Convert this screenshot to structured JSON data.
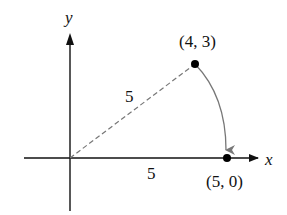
{
  "diagram": {
    "axes": {
      "x_label": "x",
      "y_label": "y"
    },
    "points": [
      {
        "label": "(4, 3)",
        "x": 4,
        "y": 3
      },
      {
        "label": "(5, 0)",
        "x": 5,
        "y": 0
      }
    ],
    "segment_labels": {
      "radius": "5",
      "x_axis_length": "5"
    },
    "colors": {
      "axes": "#111111",
      "dashed_line": "#777777",
      "arc": "#777777",
      "points": "#000000"
    }
  }
}
